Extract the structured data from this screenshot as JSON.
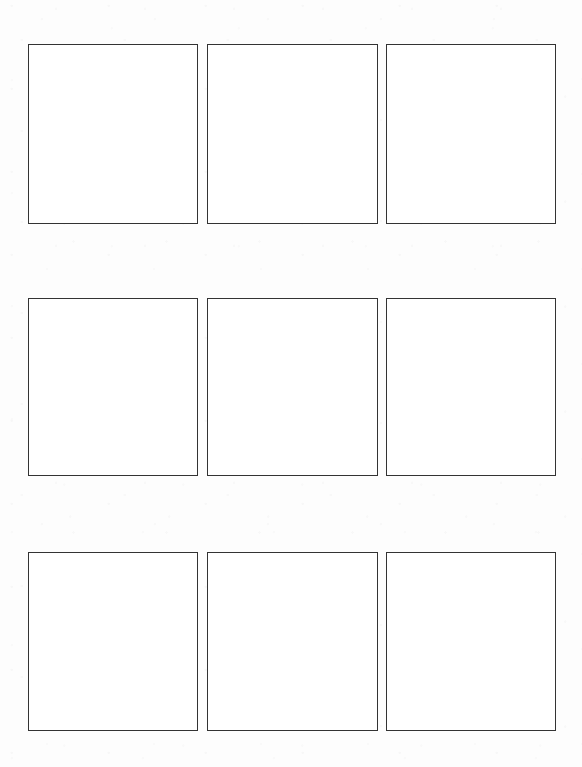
{
  "page": {
    "kind": "scanned-worksheet",
    "background_color": "#fdfdfd",
    "width": 582,
    "height": 767
  },
  "grid": {
    "rows": 3,
    "columns": 3,
    "cell_count": 9,
    "border_color": "#333333",
    "border_width_px": 1.5,
    "cell_fill_color": "#ffffff",
    "cells": [
      {
        "id": "cell-r1c1",
        "row": 1,
        "column": 1,
        "x": 28,
        "y": 44,
        "width": 170,
        "height": 180,
        "content": ""
      },
      {
        "id": "cell-r1c2",
        "row": 1,
        "column": 2,
        "x": 207,
        "y": 44,
        "width": 171,
        "height": 180,
        "content": ""
      },
      {
        "id": "cell-r1c3",
        "row": 1,
        "column": 3,
        "x": 386,
        "y": 44,
        "width": 170,
        "height": 180,
        "content": ""
      },
      {
        "id": "cell-r2c1",
        "row": 2,
        "column": 1,
        "x": 28,
        "y": 298,
        "width": 170,
        "height": 178,
        "content": ""
      },
      {
        "id": "cell-r2c2",
        "row": 2,
        "column": 2,
        "x": 207,
        "y": 298,
        "width": 171,
        "height": 178,
        "content": ""
      },
      {
        "id": "cell-r2c3",
        "row": 2,
        "column": 3,
        "x": 386,
        "y": 298,
        "width": 170,
        "height": 178,
        "content": ""
      },
      {
        "id": "cell-r3c1",
        "row": 3,
        "column": 1,
        "x": 28,
        "y": 552,
        "width": 170,
        "height": 179,
        "content": ""
      },
      {
        "id": "cell-r3c2",
        "row": 3,
        "column": 2,
        "x": 207,
        "y": 552,
        "width": 171,
        "height": 179,
        "content": ""
      },
      {
        "id": "cell-r3c3",
        "row": 3,
        "column": 3,
        "x": 386,
        "y": 552,
        "width": 170,
        "height": 179,
        "content": ""
      }
    ]
  }
}
